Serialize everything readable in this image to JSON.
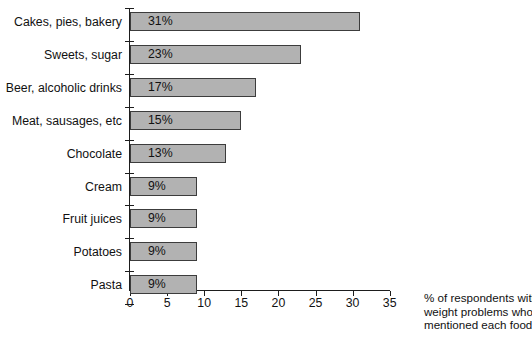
{
  "chart_data": {
    "type": "bar",
    "orientation": "horizontal",
    "title": "",
    "xlabel": "% of respondents with weight problems who mentioned each food",
    "ylabel": "",
    "categories": [
      "Cakes, pies, bakery",
      "Sweets, sugar",
      "Beer, alcoholic drinks",
      "Meat, sausages, etc",
      "Chocolate",
      "Cream",
      "Fruit juices",
      "Potatoes",
      "Pasta"
    ],
    "values": [
      31,
      23,
      17,
      15,
      13,
      9,
      9,
      9,
      9
    ],
    "value_labels": [
      "31%",
      "23%",
      "17%",
      "15%",
      "13%",
      "9%",
      "9%",
      "9%",
      "9%"
    ],
    "xlim": [
      0,
      35
    ],
    "xticks": [
      0,
      5,
      10,
      15,
      20,
      25,
      30,
      35
    ],
    "xtick_labels": [
      "0",
      "5",
      "10",
      "15",
      "20",
      "25",
      "30",
      "35"
    ],
    "grid": false,
    "legend": false,
    "bar_color": "#b2b2b2",
    "bar_edge_color": "#3c3c3c",
    "axis_color": "#1d1d1d"
  },
  "caption": {
    "line1": "% of respondents with",
    "line2": "weight problems who",
    "line3": "mentioned each food"
  }
}
